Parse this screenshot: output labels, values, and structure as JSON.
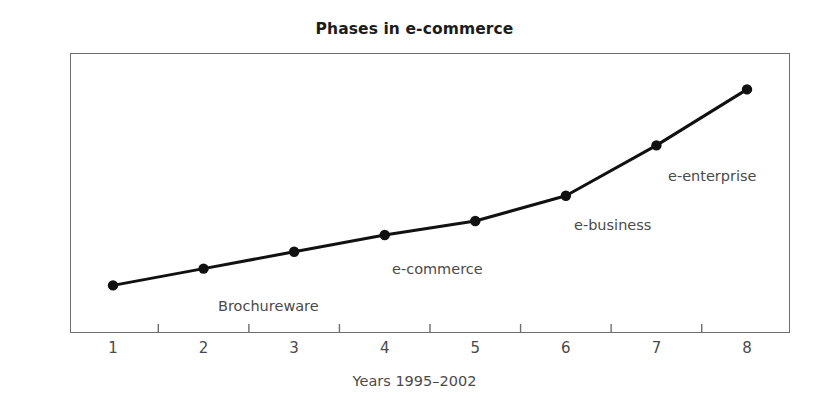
{
  "chart_data": {
    "type": "line",
    "title": "Phases in e-commerce",
    "xlabel": "Years 1995–2002",
    "ylabel": "Business impact",
    "x": [
      1,
      2,
      3,
      4,
      5,
      6,
      7,
      8
    ],
    "tick_labels": [
      "1",
      "2",
      "3",
      "4",
      "5",
      "6",
      "7",
      "8"
    ],
    "values": [
      17,
      23,
      29,
      35,
      40,
      49,
      67,
      87
    ],
    "ylim": [
      0,
      100
    ],
    "xlim": [
      0.5,
      8.5
    ],
    "grid": false,
    "legend": null,
    "series": [
      {
        "name": "Business impact",
        "values": [
          17,
          23,
          29,
          35,
          40,
          49,
          67,
          87
        ],
        "color": "#111111",
        "marker": "circle",
        "line_width": 3
      }
    ],
    "annotations": [
      {
        "text": "Brochureware",
        "near_point_x": 2,
        "x_px": 218,
        "y_px": 298
      },
      {
        "text": "e-commerce",
        "near_point_x": 4,
        "x_px": 392,
        "y_px": 261
      },
      {
        "text": "e-business",
        "near_point_x": 6,
        "x_px": 574,
        "y_px": 217
      },
      {
        "text": "e-enterprise",
        "near_point_x": 7,
        "x_px": 668,
        "y_px": 168
      }
    ]
  },
  "colors": {
    "line": "#111111",
    "marker": "#111111",
    "frame": "#6e6e6e",
    "text": "#4a4a4a",
    "title": "#1c1c1c",
    "background": "#ffffff"
  }
}
